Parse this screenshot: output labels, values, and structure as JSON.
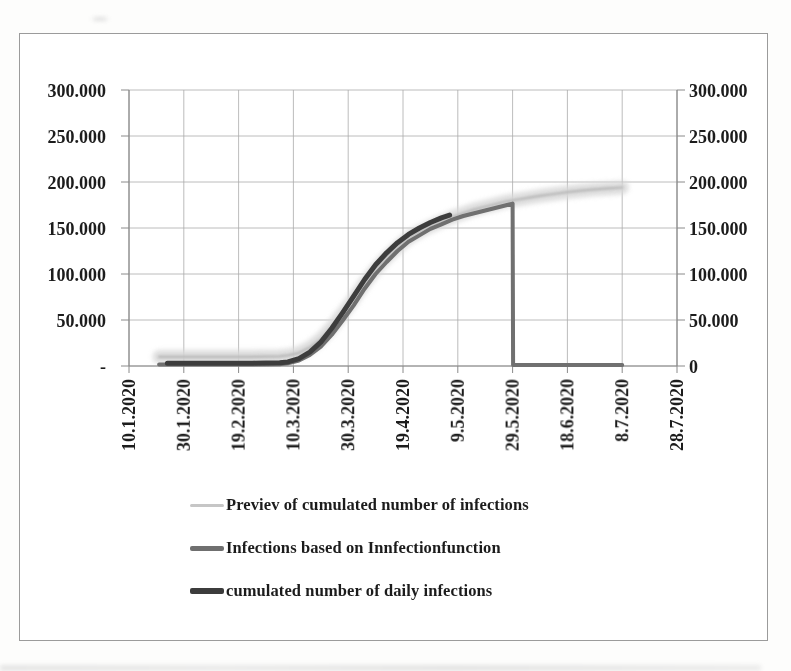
{
  "figure": {
    "background": "#ffffff",
    "frame_border_color": "#9b9b9b",
    "text_color": "#1c1c1c",
    "gridline_color": "#ababab",
    "axis_color": "#8a8a8a"
  },
  "chart_data": {
    "type": "line",
    "title": "",
    "xlabel": "",
    "ylabel": "",
    "grid": true,
    "x_axis": {
      "unit": "days since 10.1.2020",
      "tick_days": [
        0,
        20,
        40,
        60,
        80,
        100,
        120,
        140,
        160,
        180,
        200
      ],
      "tick_labels": [
        "10.1.2020",
        "30.1.2020",
        "19.2.2020",
        "10.3.2020",
        "30.3.2020",
        "19.4.2020",
        "9.5.2020",
        "29.5.2020",
        "18.6.2020",
        "8.7.2020",
        "28.7.2020"
      ],
      "label_rotation_deg": 90
    },
    "y_axis_left": {
      "tick_values": [
        0,
        50000,
        100000,
        150000,
        200000,
        250000,
        300000
      ],
      "tick_labels": [
        "-",
        "50.000",
        "100.000",
        "150.000",
        "200.000",
        "250.000",
        "300.000"
      ]
    },
    "y_axis_right": {
      "tick_values": [
        0,
        50000,
        100000,
        150000,
        200000,
        250000,
        300000
      ],
      "tick_labels": [
        "0",
        "50.000",
        "100.000",
        "150.000",
        "200.000",
        "250.000",
        "300.000"
      ]
    },
    "xlim_days": [
      0,
      200
    ],
    "ylim": [
      0,
      300000
    ],
    "series": [
      {
        "name": "Previev of cumulated number of infections",
        "style": "thick-soft-band",
        "color": "#d7d7d7",
        "core_color": "#b4b4b4",
        "width": 13,
        "points": [
          [
            11,
            10000
          ],
          [
            30,
            10000
          ],
          [
            45,
            10000
          ],
          [
            55,
            10500
          ],
          [
            58,
            11500
          ],
          [
            62,
            14000
          ],
          [
            66,
            20000
          ],
          [
            70,
            29000
          ],
          [
            74,
            42000
          ],
          [
            78,
            57000
          ],
          [
            82,
            73000
          ],
          [
            86,
            90000
          ],
          [
            90,
            105000
          ],
          [
            94,
            118000
          ],
          [
            98,
            129000
          ],
          [
            102,
            139000
          ],
          [
            106,
            146000
          ],
          [
            110,
            152000
          ],
          [
            114,
            157000
          ],
          [
            118,
            162000
          ],
          [
            122,
            166000
          ],
          [
            126,
            170000
          ],
          [
            130,
            173000
          ],
          [
            134,
            176000
          ],
          [
            138,
            179000
          ],
          [
            142,
            181000
          ],
          [
            146,
            183000
          ],
          [
            150,
            185000
          ],
          [
            155,
            187000
          ],
          [
            160,
            189000
          ],
          [
            165,
            190500
          ],
          [
            170,
            192000
          ],
          [
            175,
            193000
          ],
          [
            180,
            194000
          ]
        ]
      },
      {
        "name": "Infections based on Innfectionfunction",
        "style": "solid",
        "color": "#6f6f6f",
        "width": 4,
        "points": [
          [
            11,
            1500
          ],
          [
            30,
            1500
          ],
          [
            45,
            1500
          ],
          [
            55,
            2000
          ],
          [
            58,
            3000
          ],
          [
            62,
            6000
          ],
          [
            66,
            12000
          ],
          [
            70,
            21000
          ],
          [
            74,
            34000
          ],
          [
            78,
            49500
          ],
          [
            82,
            66000
          ],
          [
            86,
            84000
          ],
          [
            90,
            100000
          ],
          [
            94,
            113000
          ],
          [
            98,
            125000
          ],
          [
            102,
            135000
          ],
          [
            106,
            142000
          ],
          [
            110,
            149000
          ],
          [
            114,
            154000
          ],
          [
            118,
            159000
          ],
          [
            122,
            163000
          ],
          [
            126,
            166000
          ],
          [
            130,
            169000
          ],
          [
            134,
            172000
          ],
          [
            138,
            175000
          ],
          [
            140,
            176500
          ],
          [
            140.2,
            1200
          ],
          [
            150,
            1200
          ],
          [
            165,
            1200
          ],
          [
            180,
            1200
          ]
        ]
      },
      {
        "name": "cumulated number of daily infections",
        "style": "solid",
        "color": "#3d3d3d",
        "width": 5,
        "points": [
          [
            14,
            3000
          ],
          [
            30,
            3000
          ],
          [
            45,
            3000
          ],
          [
            55,
            3500
          ],
          [
            58,
            4500
          ],
          [
            62,
            8000
          ],
          [
            66,
            15000
          ],
          [
            70,
            26000
          ],
          [
            74,
            41000
          ],
          [
            78,
            58000
          ],
          [
            82,
            76000
          ],
          [
            86,
            94000
          ],
          [
            90,
            110000
          ],
          [
            94,
            123000
          ],
          [
            98,
            134000
          ],
          [
            102,
            143000
          ],
          [
            106,
            150000
          ],
          [
            110,
            156000
          ],
          [
            114,
            161000
          ],
          [
            117,
            164000
          ]
        ]
      }
    ],
    "legend": {
      "position": "bottom",
      "entries": [
        {
          "label": "Previev of cumulated number of infections",
          "color": "#c6c6c6",
          "swatch_thickness_px": 3
        },
        {
          "label": "Infections based on Innfectionfunction",
          "color": "#6f6f6f",
          "swatch_thickness_px": 5
        },
        {
          "label": "cumulated number of daily infections",
          "color": "#3c3c3c",
          "swatch_thickness_px": 6
        }
      ]
    }
  }
}
